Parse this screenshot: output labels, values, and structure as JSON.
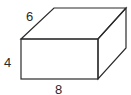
{
  "diagram": {
    "type": "rectangular-prism",
    "dimensions": {
      "depth": "6",
      "height": "4",
      "width": "8"
    },
    "colors": {
      "stroke": "#2a2a2a",
      "background": "#ffffff"
    }
  }
}
